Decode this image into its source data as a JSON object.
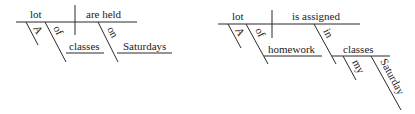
{
  "diagrams": [
    {
      "sentence_parts": {
        "subject": "lot",
        "predicate": "are held",
        "modifier_1": "A",
        "preposition_1": "of",
        "object_1": "classes",
        "preposition_2": "on",
        "object_2": "Saturdays"
      }
    },
    {
      "sentence_parts": {
        "subject": "lot",
        "predicate": "is assigned",
        "modifier_1": "A",
        "preposition_1": "of",
        "object_1": "homework",
        "preposition_2": "in",
        "object_2": "classes",
        "object_2_modifier_1": "my",
        "object_2_modifier_2": "Saturday"
      }
    }
  ]
}
